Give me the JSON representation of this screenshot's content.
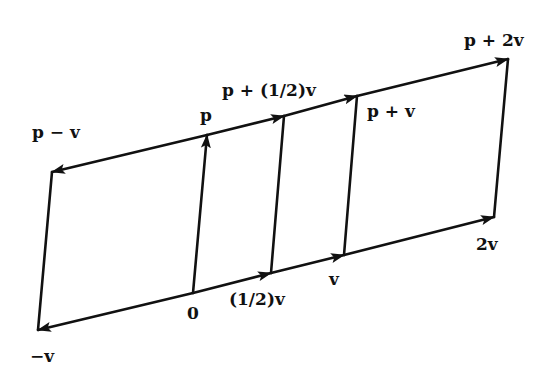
{
  "diagram": {
    "colors": {
      "line": "#111111",
      "background": "#ffffff"
    },
    "points": {
      "origin": {
        "label": "0",
        "x": 193,
        "y": 293
      },
      "neg_v": {
        "label": "−v",
        "x": 38,
        "y": 330
      },
      "half_v": {
        "label": "(1/2)v",
        "x": 271,
        "y": 273
      },
      "v": {
        "label": "v",
        "x": 344,
        "y": 255
      },
      "two_v": {
        "label": "2v",
        "x": 494,
        "y": 217
      },
      "p": {
        "label": "p",
        "x": 207,
        "y": 135
      },
      "p_minus_v": {
        "label": "p − v",
        "x": 52,
        "y": 172
      },
      "p_plus_half_v": {
        "label": "p + (1/2)v",
        "x": 284,
        "y": 116
      },
      "p_plus_v": {
        "label": "p + v",
        "x": 357,
        "y": 96
      },
      "p_plus_2v": {
        "label": "p + 2v",
        "x": 508,
        "y": 59
      }
    },
    "labels": [
      {
        "key": "p_minus_v",
        "text": "p − v",
        "x": 32,
        "y": 124
      },
      {
        "key": "p",
        "text": "p",
        "x": 200,
        "y": 107
      },
      {
        "key": "p_plus_half_v",
        "text": "p + (1/2)v",
        "x": 222,
        "y": 82
      },
      {
        "key": "p_plus_v",
        "text": "p + v",
        "x": 367,
        "y": 103
      },
      {
        "key": "p_plus_2v",
        "text": "p + 2v",
        "x": 464,
        "y": 32
      },
      {
        "key": "origin",
        "text": "0",
        "x": 187,
        "y": 305
      },
      {
        "key": "half_v",
        "text": "(1/2)v",
        "x": 229,
        "y": 291
      },
      {
        "key": "v",
        "text": "v",
        "x": 329,
        "y": 271
      },
      {
        "key": "two_v",
        "text": "2v",
        "x": 476,
        "y": 236
      },
      {
        "key": "neg_v",
        "text": "−v",
        "x": 30,
        "y": 348
      }
    ]
  }
}
